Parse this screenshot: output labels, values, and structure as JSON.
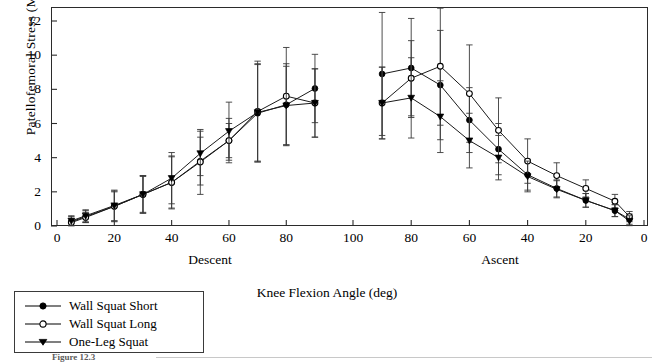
{
  "figure": {
    "caption_partial": "Figure 12.3",
    "y_axis_label": "Patellofemoral Stress (MPa)",
    "x_axis_label": "Knee Flexion Angle (deg)",
    "phase_left_label": "Descent",
    "phase_right_label": "Ascent"
  },
  "legend": {
    "items": [
      {
        "label": "Wall Squat Short",
        "marker": "filled-circle",
        "color": "#000000"
      },
      {
        "label": "Wall Squat Long",
        "marker": "open-circle",
        "color": "#000000"
      },
      {
        "label": "One-Leg Squat",
        "marker": "filled-triangle-down",
        "color": "#000000"
      }
    ]
  },
  "axes": {
    "y_ticks": [
      "0",
      "2",
      "4",
      "6",
      "8",
      "10",
      "12"
    ],
    "y_min": 0,
    "y_max": 12.8,
    "descent_ticks": [
      "0",
      "20",
      "40",
      "60",
      "80"
    ],
    "ascent_ticks": [
      "100",
      "80",
      "60",
      "40",
      "20",
      "0"
    ]
  },
  "chart_data": {
    "type": "line",
    "title": "",
    "xlabel": "Knee Flexion Angle (deg)",
    "ylabel": "Patellofemoral Stress (MPa)",
    "ylim": [
      0,
      12.8
    ],
    "grid": false,
    "legend_position": "bottom-left",
    "error_bars": "standard-deviation",
    "phases": [
      "Descent",
      "Ascent"
    ],
    "x_descent": [
      5,
      10,
      20,
      30,
      40,
      50,
      60,
      70,
      80,
      90
    ],
    "x_ascent": [
      90,
      80,
      70,
      60,
      50,
      40,
      30,
      20,
      10,
      5
    ],
    "series": [
      {
        "name": "Wall Squat Short",
        "marker": "filled-circle",
        "descent": [
          0.25,
          0.55,
          1.15,
          1.85,
          2.55,
          3.8,
          5.0,
          6.6,
          7.1,
          8.05
        ],
        "descent_err": [
          0.3,
          0.35,
          0.9,
          1.1,
          1.55,
          1.4,
          1.0,
          2.85,
          2.4,
          2.0
        ],
        "ascent": [
          8.9,
          9.25,
          8.25,
          6.2,
          4.5,
          3.0,
          2.2,
          1.5,
          0.9,
          0.4
        ],
        "ascent_err": [
          3.6,
          2.9,
          3.2,
          1.9,
          1.5,
          0.9,
          0.5,
          0.4,
          0.35,
          0.3
        ]
      },
      {
        "name": "Wall Squat Long",
        "marker": "open-circle",
        "descent": [
          0.2,
          0.5,
          1.15,
          1.85,
          2.55,
          3.75,
          5.0,
          6.7,
          7.6,
          7.2
        ],
        "descent_err": [
          0.25,
          0.3,
          0.85,
          1.05,
          1.5,
          1.9,
          1.3,
          2.95,
          2.85,
          2.0
        ],
        "ascent": [
          7.2,
          8.65,
          9.35,
          7.75,
          5.6,
          3.8,
          2.95,
          2.2,
          1.45,
          0.55
        ],
        "ascent_err": [
          2.1,
          2.2,
          3.45,
          2.85,
          1.9,
          1.3,
          0.75,
          0.5,
          0.4,
          0.3
        ]
      },
      {
        "name": "One-Leg Squat",
        "marker": "filled-triangle-down",
        "descent": [
          0.3,
          0.6,
          1.2,
          1.85,
          2.8,
          4.25,
          5.55,
          6.65,
          7.05,
          7.2
        ],
        "descent_err": [
          0.3,
          0.35,
          0.9,
          1.1,
          1.5,
          1.3,
          1.7,
          2.85,
          2.3,
          2.0
        ],
        "ascent": [
          7.2,
          7.5,
          6.4,
          5.0,
          4.0,
          2.9,
          2.15,
          1.5,
          0.9,
          0.3
        ],
        "ascent_err": [
          2.1,
          2.35,
          2.1,
          1.6,
          1.3,
          0.9,
          0.5,
          0.4,
          0.35,
          0.3
        ]
      }
    ]
  }
}
